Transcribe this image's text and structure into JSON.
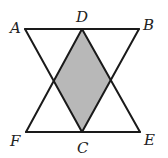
{
  "figure": {
    "colors": {
      "line": "#1a1a1a",
      "shade": "#b8b8b8",
      "background": "#ffffff"
    },
    "points": {
      "A": {
        "label": "A",
        "x": 25,
        "y": 29,
        "label_x": 10,
        "label_y": 33
      },
      "D": {
        "label": "D",
        "x": 82,
        "y": 29,
        "label_x": 76,
        "label_y": 22
      },
      "B": {
        "label": "B",
        "x": 139,
        "y": 29,
        "label_x": 143,
        "label_y": 29
      },
      "F": {
        "label": "F",
        "x": 26,
        "y": 132,
        "label_x": 10,
        "label_y": 145
      },
      "C": {
        "label": "C",
        "x": 82,
        "y": 132,
        "label_x": 77,
        "label_y": 152
      },
      "E": {
        "label": "E",
        "x": 140,
        "y": 132,
        "label_x": 144,
        "label_y": 144
      }
    },
    "segments": [
      [
        "A",
        "B"
      ],
      [
        "F",
        "E"
      ],
      [
        "A",
        "C"
      ],
      [
        "B",
        "C"
      ],
      [
        "D",
        "F"
      ],
      [
        "D",
        "E"
      ]
    ],
    "shaded_region": "rhombus D - left intersection - C - right intersection"
  }
}
